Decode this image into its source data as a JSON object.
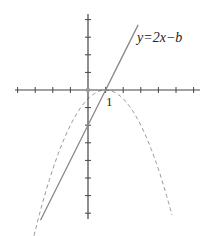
{
  "chart_data": {
    "type": "line",
    "title": "",
    "xlabel": "",
    "ylabel": "",
    "grid": false,
    "legend": null,
    "xlim": [
      -4,
      6.3
    ],
    "ylim": [
      -7.3,
      4.3
    ],
    "x_ticks": [
      -4,
      -3,
      -2,
      -1,
      0,
      1,
      2,
      3,
      4,
      5,
      6
    ],
    "y_ticks": [
      4,
      3,
      2,
      1,
      0,
      -1,
      -2,
      -3,
      -4,
      -5,
      -6,
      -7
    ],
    "tick_labels": [
      {
        "axis": "x",
        "value": 1,
        "text": "1"
      }
    ],
    "series": [
      {
        "name": "y=2x−b",
        "style": "solid",
        "color": "#888888",
        "equation": "y = 2x - 2",
        "points": [
          [
            -2.7,
            -7.4
          ],
          [
            2.85,
            3.7
          ]
        ]
      },
      {
        "name": "parabola",
        "style": "dashed",
        "color": "#999999",
        "equation": "y = -(x-1)^2/2",
        "points": [
          [
            -3.07,
            -8.3
          ],
          [
            -2,
            -4.5
          ],
          [
            -1,
            -2
          ],
          [
            0,
            -0.5
          ],
          [
            1,
            0
          ],
          [
            2,
            -0.5
          ],
          [
            3,
            -2
          ],
          [
            4,
            -4.5
          ],
          [
            4.77,
            -7.1
          ]
        ]
      }
    ],
    "annotations": [
      {
        "text": "y=2x−b",
        "attached_to": "line",
        "position": "upper right end of line"
      },
      {
        "text": "1",
        "position": "below x-axis at x=1"
      }
    ]
  },
  "labels": {
    "line_label": "y=2x−b",
    "tick_one": "1"
  },
  "colors": {
    "axis": "#444444",
    "line": "#8a8a8a",
    "parabola": "#9a9a9a",
    "background": "#ffffff"
  }
}
